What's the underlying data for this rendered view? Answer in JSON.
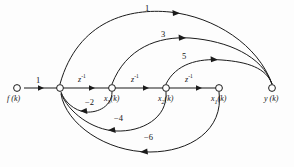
{
  "diagram": {
    "type": "signal-flow-graph",
    "background_color": "#fdfdfd",
    "line_color": "#1b1b1b",
    "nodes": [
      {
        "id": "f",
        "label_text": "f (k)",
        "label_main": "f",
        "label_arg": "(k)",
        "x": 17,
        "y": 88
      },
      {
        "id": "x4",
        "label_text": "",
        "label_main": "",
        "label_arg": "",
        "x": 60,
        "y": 88
      },
      {
        "id": "x3",
        "label_text": "x3(k)",
        "label_main": "x",
        "label_sub": "3",
        "label_arg": "(k)",
        "x": 112,
        "y": 88
      },
      {
        "id": "x2",
        "label_text": "x2(k)",
        "label_main": "x",
        "label_sub": "2",
        "label_arg": "(k)",
        "x": 166,
        "y": 88
      },
      {
        "id": "x1",
        "label_text": "x1(k)",
        "label_main": "x",
        "label_sub": "1",
        "label_arg": "(k)",
        "x": 219,
        "y": 88
      },
      {
        "id": "y",
        "label_text": "y (k)",
        "label_main": "y",
        "label_arg": "(k)",
        "x": 272,
        "y": 88
      }
    ],
    "edges": [
      {
        "from": "f",
        "to": "x4",
        "gain": "1",
        "shape": "straight",
        "label_position": "above"
      },
      {
        "from": "x4",
        "to": "x3",
        "gain": "z-1",
        "gain_base": "z",
        "gain_exp": "-1",
        "shape": "straight",
        "label_position": "above"
      },
      {
        "from": "x3",
        "to": "x2",
        "gain": "z-1",
        "gain_base": "z",
        "gain_exp": "-1",
        "shape": "straight",
        "label_position": "above"
      },
      {
        "from": "x2",
        "to": "x1",
        "gain": "z-1",
        "gain_base": "z",
        "gain_exp": "-1",
        "shape": "straight",
        "label_position": "above"
      },
      {
        "from": "x4",
        "to": "y",
        "gain": "1",
        "shape": "arc-above",
        "label_position": "above"
      },
      {
        "from": "x3",
        "to": "y",
        "gain": "3",
        "shape": "arc-above",
        "label_position": "above"
      },
      {
        "from": "x2",
        "to": "y",
        "gain": "5",
        "shape": "arc-above",
        "label_position": "above"
      },
      {
        "from": "x3",
        "to": "x4",
        "gain": "-2",
        "shape": "arc-below",
        "label_position": "below"
      },
      {
        "from": "x2",
        "to": "x4",
        "gain": "-4",
        "shape": "arc-below",
        "label_position": "below"
      },
      {
        "from": "x1",
        "to": "x4",
        "gain": "-6",
        "shape": "arc-below",
        "label_position": "below"
      }
    ],
    "gain_labels": {
      "input_gain": "1",
      "delay": "z",
      "delay_exponent": "-1",
      "forward_1": "1",
      "forward_3": "3",
      "forward_5": "5",
      "feedback_2": "−2",
      "feedback_4": "−4",
      "feedback_6": "−6"
    }
  }
}
